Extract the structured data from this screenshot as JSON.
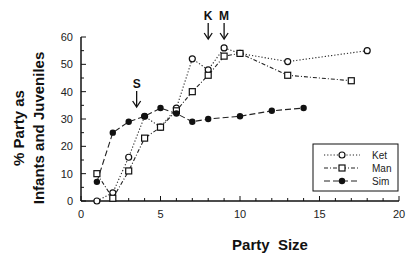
{
  "chart_data": {
    "type": "line",
    "title": "",
    "xlabel": "Party  Size",
    "ylabel_line1": "% Party as",
    "ylabel_line2": "Infants and  Juveniles",
    "xlim": [
      0,
      20
    ],
    "ylim": [
      0,
      60
    ],
    "xticks": [
      0,
      5,
      10,
      15,
      20
    ],
    "yticks": [
      0,
      10,
      20,
      30,
      40,
      50,
      60
    ],
    "grid": false,
    "legend_position": "bottom-right",
    "series": [
      {
        "name": "Ket",
        "marker": "open-circle",
        "dash": "dotted",
        "x": [
          1,
          2,
          3,
          4,
          5,
          6,
          7,
          8,
          9,
          10,
          13,
          18
        ],
        "y": [
          0,
          3,
          16,
          31,
          27,
          34,
          52,
          48,
          56,
          54,
          51,
          55
        ]
      },
      {
        "name": "Man",
        "marker": "open-square",
        "dash": "dash-dot",
        "x": [
          1,
          2,
          3,
          4,
          5,
          6,
          7,
          8,
          9,
          10,
          13,
          17
        ],
        "y": [
          10,
          1,
          11,
          23,
          27,
          33,
          40,
          46,
          53,
          54,
          46,
          44
        ]
      },
      {
        "name": "Sim",
        "marker": "filled-circle",
        "dash": "dashed",
        "x": [
          1,
          2,
          3,
          4,
          5,
          6,
          7,
          8,
          10,
          12,
          14
        ],
        "y": [
          7,
          25,
          29,
          31,
          34,
          32,
          29,
          30,
          31,
          33,
          34
        ]
      }
    ],
    "annotations": [
      {
        "label": "S",
        "x": 3.5,
        "arrow": "down"
      },
      {
        "label": "K",
        "x": 8,
        "arrow": "down"
      },
      {
        "label": "M",
        "x": 9,
        "arrow": "down"
      }
    ]
  }
}
